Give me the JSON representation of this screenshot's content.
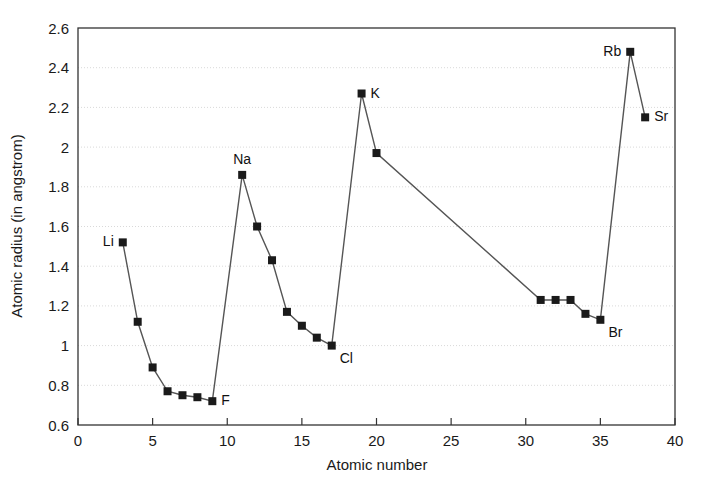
{
  "chart_data": {
    "type": "line",
    "title": "",
    "xlabel": "Atomic number",
    "ylabel": "Atomic radius (in angstrom)",
    "xlim": [
      0,
      40
    ],
    "ylim": [
      0.6,
      2.6
    ],
    "xticks": [
      "0",
      "5",
      "10",
      "15",
      "20",
      "25",
      "30",
      "35",
      "40"
    ],
    "xtick_values": [
      0,
      5,
      10,
      15,
      20,
      25,
      30,
      35,
      40
    ],
    "yticks": [
      "0.6",
      "0.8",
      "1",
      "1.2",
      "1.4",
      "1.6",
      "1.8",
      "2",
      "2.2",
      "2.4",
      "2.6"
    ],
    "ytick_values": [
      0.6,
      0.8,
      1.0,
      1.2,
      1.4,
      1.6,
      1.8,
      2.0,
      2.2,
      2.4,
      2.6
    ],
    "grid": true,
    "grid_axis": "y",
    "legend": "none",
    "marker": "square",
    "marker_color": "#1a1a1a",
    "line_color": "#555555",
    "axis_color": "#333333",
    "grid_color": "#d9d9d9",
    "background": "#ffffff",
    "x": [
      3,
      4,
      5,
      6,
      7,
      8,
      9,
      11,
      12,
      13,
      14,
      15,
      16,
      17,
      19,
      20,
      31,
      32,
      33,
      34,
      35,
      37,
      38
    ],
    "y": [
      1.52,
      1.12,
      0.89,
      0.77,
      0.75,
      0.74,
      0.72,
      1.86,
      1.6,
      1.43,
      1.17,
      1.1,
      1.04,
      1.0,
      2.27,
      1.97,
      1.23,
      1.23,
      1.23,
      1.16,
      1.13,
      2.48,
      2.15
    ],
    "series": [
      {
        "name": "Atomic radius",
        "points": [
          {
            "x": 3,
            "y": 1.52,
            "label": "Li",
            "label_pos": "left"
          },
          {
            "x": 4,
            "y": 1.12,
            "label": "",
            "label_pos": ""
          },
          {
            "x": 5,
            "y": 0.89,
            "label": "",
            "label_pos": ""
          },
          {
            "x": 6,
            "y": 0.77,
            "label": "",
            "label_pos": ""
          },
          {
            "x": 7,
            "y": 0.75,
            "label": "",
            "label_pos": ""
          },
          {
            "x": 8,
            "y": 0.74,
            "label": "",
            "label_pos": ""
          },
          {
            "x": 9,
            "y": 0.72,
            "label": "F",
            "label_pos": "right"
          },
          {
            "x": 11,
            "y": 1.86,
            "label": "Na",
            "label_pos": "above"
          },
          {
            "x": 12,
            "y": 1.6,
            "label": "",
            "label_pos": ""
          },
          {
            "x": 13,
            "y": 1.43,
            "label": "",
            "label_pos": ""
          },
          {
            "x": 14,
            "y": 1.17,
            "label": "",
            "label_pos": ""
          },
          {
            "x": 15,
            "y": 1.1,
            "label": "",
            "label_pos": ""
          },
          {
            "x": 16,
            "y": 1.04,
            "label": "",
            "label_pos": ""
          },
          {
            "x": 17,
            "y": 1.0,
            "label": "Cl",
            "label_pos": "below-right"
          },
          {
            "x": 19,
            "y": 2.27,
            "label": "K",
            "label_pos": "right"
          },
          {
            "x": 20,
            "y": 1.97,
            "label": "",
            "label_pos": ""
          },
          {
            "x": 31,
            "y": 1.23,
            "label": "",
            "label_pos": ""
          },
          {
            "x": 32,
            "y": 1.23,
            "label": "",
            "label_pos": ""
          },
          {
            "x": 33,
            "y": 1.23,
            "label": "",
            "label_pos": ""
          },
          {
            "x": 34,
            "y": 1.16,
            "label": "",
            "label_pos": ""
          },
          {
            "x": 35,
            "y": 1.13,
            "label": "Br",
            "label_pos": "below-right"
          },
          {
            "x": 37,
            "y": 2.48,
            "label": "Rb",
            "label_pos": "left"
          },
          {
            "x": 38,
            "y": 2.15,
            "label": "Sr",
            "label_pos": "right"
          }
        ]
      }
    ],
    "annotations": [
      {
        "text": "Li",
        "x": 3,
        "y": 1.52
      },
      {
        "text": "F",
        "x": 9,
        "y": 0.72
      },
      {
        "text": "Na",
        "x": 11,
        "y": 1.86
      },
      {
        "text": "Cl",
        "x": 17,
        "y": 1.0
      },
      {
        "text": "K",
        "x": 19,
        "y": 2.27
      },
      {
        "text": "Br",
        "x": 35,
        "y": 1.13
      },
      {
        "text": "Rb",
        "x": 37,
        "y": 2.48
      },
      {
        "text": "Sr",
        "x": 38,
        "y": 2.15
      }
    ]
  }
}
